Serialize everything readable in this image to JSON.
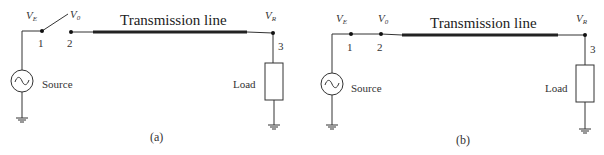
{
  "panels": [
    {
      "id": "a",
      "caption": "(a)",
      "line_label": "Transmission line",
      "source_label": "Source",
      "load_label": "Load",
      "voltages": {
        "send": {
          "main": "V",
          "sub": "E"
        },
        "open": {
          "main": "V",
          "sub": "0"
        },
        "recv": {
          "main": "V",
          "sub": "R"
        }
      },
      "nodes": [
        "1",
        "2",
        "3"
      ],
      "switch_state": "open"
    },
    {
      "id": "b",
      "caption": "(b)",
      "line_label": "Transmission line",
      "source_label": "Source",
      "load_label": "Load",
      "voltages": {
        "send": {
          "main": "V",
          "sub": "E"
        },
        "open": {
          "main": "V",
          "sub": "0"
        },
        "recv": {
          "main": "V",
          "sub": "R"
        }
      },
      "nodes": [
        "1",
        "2",
        "3"
      ],
      "switch_state": "closed"
    }
  ]
}
